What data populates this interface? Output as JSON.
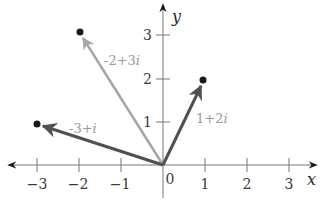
{
  "diagram": {
    "type": "complex-plane",
    "axes": {
      "x_label": "x",
      "y_label": "y",
      "origin_label": "0",
      "x_ticks": [
        {
          "value": -3,
          "label": "−3"
        },
        {
          "value": -2,
          "label": "−2"
        },
        {
          "value": -1,
          "label": "−1"
        },
        {
          "value": 1,
          "label": "1"
        },
        {
          "value": 2,
          "label": "2"
        },
        {
          "value": 3,
          "label": "3"
        }
      ],
      "y_ticks": [
        {
          "value": 1,
          "label": "1"
        },
        {
          "value": 2,
          "label": "2"
        },
        {
          "value": 3,
          "label": "3"
        }
      ],
      "x_range": [
        -3.7,
        3.7
      ],
      "y_range": [
        -0.8,
        3.7
      ]
    },
    "vectors": [
      {
        "id": "v1",
        "label": "-2+3",
        "label_i": "i",
        "re": -2,
        "im": 3,
        "color": "#a6a6a6"
      },
      {
        "id": "v2",
        "label": "-3+",
        "label_i": "i",
        "re": -3,
        "im": 1,
        "color": "#505050"
      },
      {
        "id": "v3",
        "label": "1+2",
        "label_i": "i",
        "re": 1,
        "im": 2,
        "color": "#505050"
      }
    ],
    "colors": {
      "axis": "#777777",
      "point": "#1a1a1a",
      "label": "#9a9a9a"
    }
  }
}
